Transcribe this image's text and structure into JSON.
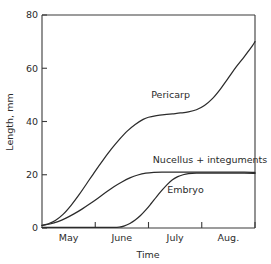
{
  "chart_data": {
    "type": "line",
    "title": "",
    "xlabel": "Time",
    "ylabel": "Length, mm",
    "ylim": [
      0,
      80
    ],
    "yticks": [
      0,
      20,
      40,
      60,
      80
    ],
    "ytick_labels": [
      "0",
      "20",
      "40",
      "60",
      "80"
    ],
    "xlim": [
      0,
      4
    ],
    "xtick_labels": [
      "May",
      "June",
      "July",
      "Aug."
    ],
    "x_axis_note": "ticks at month boundaries; labels centered within each month span",
    "grid": false,
    "legend": "inline-labels",
    "series": [
      {
        "name": "Pericarp",
        "label": "Pericarp",
        "label_x_month": 2.05,
        "label_y_mm": 49,
        "x": [
          0.0,
          0.12,
          0.25,
          0.4,
          0.55,
          0.7,
          0.85,
          1.0,
          1.15,
          1.3,
          1.45,
          1.6,
          1.75,
          1.9,
          2.0,
          2.15,
          2.3,
          2.45,
          2.6,
          2.75,
          2.9,
          3.05,
          3.2,
          3.35,
          3.5,
          3.65,
          3.8,
          3.95,
          4.0
        ],
        "values": [
          1.0,
          1.6,
          2.8,
          5.2,
          8.6,
          12.6,
          17.0,
          21.4,
          25.6,
          29.6,
          33.2,
          36.4,
          38.9,
          40.8,
          41.6,
          42.2,
          42.6,
          42.9,
          43.2,
          43.6,
          44.4,
          46.0,
          48.6,
          52.2,
          56.4,
          60.6,
          64.4,
          68.4,
          70.0
        ]
      },
      {
        "name": "Nucellus + integuments",
        "label": "Nucellus + integuments",
        "label_x_month": 2.08,
        "label_y_mm": 24.4,
        "x": [
          0.0,
          0.15,
          0.3,
          0.45,
          0.6,
          0.75,
          0.9,
          1.05,
          1.2,
          1.35,
          1.5,
          1.65,
          1.8,
          1.95,
          2.1,
          2.25,
          2.4,
          2.6,
          2.8,
          3.0,
          3.2,
          3.4,
          3.6,
          3.8,
          4.0
        ],
        "values": [
          1.0,
          1.5,
          2.4,
          3.7,
          5.3,
          7.1,
          9.1,
          11.2,
          13.4,
          15.5,
          17.3,
          18.8,
          19.9,
          20.6,
          20.9,
          21.0,
          21.0,
          21.0,
          21.0,
          21.0,
          21.0,
          21.0,
          21.0,
          21.0,
          20.9
        ]
      },
      {
        "name": "Embryo",
        "label": "Embryo",
        "label_x_month": 2.35,
        "label_y_mm": 13.0,
        "x": [
          0.0,
          0.5,
          1.0,
          1.3,
          1.45,
          1.55,
          1.65,
          1.75,
          1.85,
          1.95,
          2.05,
          2.15,
          2.25,
          2.35,
          2.45,
          2.55,
          2.65,
          2.75,
          2.9,
          3.1,
          3.3,
          3.55,
          3.8,
          4.0
        ],
        "values": [
          0.2,
          0.2,
          0.2,
          0.2,
          0.3,
          0.8,
          1.7,
          3.0,
          4.7,
          6.8,
          9.2,
          11.7,
          14.1,
          16.3,
          18.1,
          19.3,
          20.0,
          20.4,
          20.6,
          20.6,
          20.6,
          20.6,
          20.6,
          20.5
        ]
      }
    ]
  },
  "axes": {
    "y_title": "Length, mm",
    "x_title": "Time"
  },
  "colors": {
    "axis": "#3a3a3a",
    "curve": "#2b2b2b",
    "text": "#2b2b2b",
    "background": "#ffffff"
  }
}
